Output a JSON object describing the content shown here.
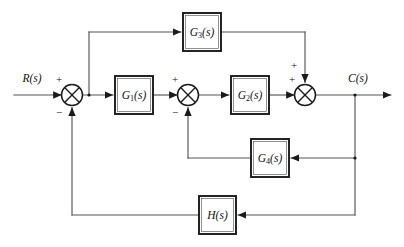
{
  "diagram": {
    "type": "control-system-block-diagram",
    "title": "",
    "background_color": "#ffffff",
    "line_color": "#555555",
    "block_border_color": "#1a1a1a",
    "text_color": "#111111",
    "io_labels": {
      "input": "R(s)",
      "output": "C(s)"
    },
    "blocks": [
      {
        "id": "G1",
        "label_main": "G",
        "label_sub": "1",
        "label_tail": "(s)",
        "label_full": "G1(s)",
        "x": 115,
        "y": 76,
        "w": 38,
        "h": 38
      },
      {
        "id": "G2",
        "label_main": "G",
        "label_sub": "2",
        "label_tail": "(s)",
        "label_full": "G2(s)",
        "x": 231,
        "y": 76,
        "w": 38,
        "h": 38
      },
      {
        "id": "G3",
        "label_main": "G",
        "label_sub": "3",
        "label_tail": "(s)",
        "label_full": "G3(s)",
        "x": 183,
        "y": 13,
        "w": 38,
        "h": 38
      },
      {
        "id": "G4",
        "label_main": "G",
        "label_sub": "4",
        "label_tail": "(s)",
        "label_full": "G4(s)",
        "x": 251,
        "y": 139,
        "w": 38,
        "h": 38
      },
      {
        "id": "H",
        "label_main": "H",
        "label_sub": "",
        "label_tail": "(s)",
        "label_full": "H(s)",
        "x": 199,
        "y": 196,
        "w": 37,
        "h": 38
      }
    ],
    "summing_junctions": [
      {
        "id": "sum1",
        "cx": 72,
        "cy": 95,
        "r": 10.5,
        "signs": [
          {
            "text": "+",
            "x": 59,
            "y": 80
          },
          {
            "text": "−",
            "x": 59,
            "y": 113
          }
        ]
      },
      {
        "id": "sum2",
        "cx": 188,
        "cy": 95,
        "r": 10.5,
        "signs": [
          {
            "text": "+",
            "x": 175,
            "y": 80
          },
          {
            "text": "−",
            "x": 175,
            "y": 113
          }
        ]
      },
      {
        "id": "sum3",
        "cx": 305,
        "cy": 95,
        "r": 10.5,
        "signs": [
          {
            "text": "+",
            "x": 292,
            "y": 80
          },
          {
            "text": "+",
            "x": 294,
            "y": 66
          }
        ]
      }
    ],
    "branch_points": [
      {
        "id": "branch-g3-tap",
        "x": 89,
        "y": 95
      },
      {
        "id": "branch-output-tap",
        "x": 355,
        "y": 95
      }
    ],
    "signal_paths": [
      {
        "id": "input-to-sum1",
        "from": "R(s)",
        "to": "sum1"
      },
      {
        "id": "sum1-to-g1",
        "from": "sum1",
        "to": "G1"
      },
      {
        "id": "g1-to-sum2",
        "from": "G1",
        "to": "sum2"
      },
      {
        "id": "sum2-to-g2",
        "from": "sum2",
        "to": "G2"
      },
      {
        "id": "g2-to-sum3",
        "from": "G2",
        "to": "sum3"
      },
      {
        "id": "sum3-to-output",
        "from": "sum3",
        "to": "C(s)"
      },
      {
        "id": "feedforward-g3",
        "from": "branch-g3-tap",
        "to": "G3"
      },
      {
        "id": "g3-to-sum3",
        "from": "G3",
        "to": "sum3"
      },
      {
        "id": "feedback-g4",
        "from": "branch-output-tap",
        "to": "G4"
      },
      {
        "id": "g4-to-sum2",
        "from": "G4",
        "to": "sum2"
      },
      {
        "id": "feedback-h",
        "from": "branch-output-tap",
        "to": "H"
      },
      {
        "id": "h-to-sum1",
        "from": "H",
        "to": "sum1"
      }
    ]
  }
}
